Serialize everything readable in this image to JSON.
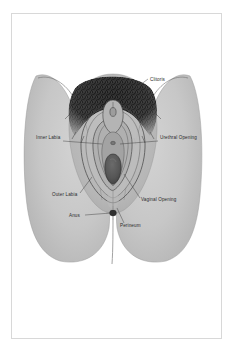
{
  "page": {
    "top_clipped_text": "· · ·",
    "background_color": "#ffffff"
  },
  "frame": {
    "border_color": "#d8d8d8",
    "fill_color": "#ffffff"
  },
  "diagram": {
    "type": "anatomical-illustration",
    "style": "greyscale line drawing with shading",
    "palette": {
      "skin_light": "#c9c9c9",
      "skin_mid": "#b8b8b8",
      "skin_shadow": "#a6a6a6",
      "inner_tissue": "#b0b0b0",
      "inner_tissue_dark": "#9a9a9a",
      "opening_dark": "#4e4e4e",
      "hair_dark": "#2f2f2f",
      "outline": "#3a3a3a",
      "label_text": "#2b2b2b",
      "leader_line": "#3a3a3a"
    },
    "labels": [
      {
        "id": "clitoris",
        "text": "Clitoris",
        "text_x": 138,
        "text_y": 67,
        "anchor": "start",
        "leader": "M 136 65 L 124 74 L 112 86"
      },
      {
        "id": "inner-labia",
        "text": "Inner Labia",
        "text_x": 24,
        "text_y": 125,
        "anchor": "start",
        "leader": "M 51 127 L 90 130"
      },
      {
        "id": "urethral-opening",
        "text": "Urethral Opening",
        "text_x": 148,
        "text_y": 125,
        "anchor": "start",
        "leader": "M 146 127 L 108 130"
      },
      {
        "id": "outer-labia",
        "text": "Outer Labia",
        "text_x": 40,
        "text_y": 182,
        "anchor": "start",
        "leader": "M 68 179 L 80 163"
      },
      {
        "id": "vaginal-opening",
        "text": "Vaginal Opening",
        "text_x": 129,
        "text_y": 187,
        "anchor": "start",
        "leader": "M 128 184 L 112 160"
      },
      {
        "id": "anus",
        "text": "Anus",
        "text_x": 57,
        "text_y": 203,
        "anchor": "start",
        "leader": "M 73 201 L 99 199"
      },
      {
        "id": "perineum",
        "text": "Perineum",
        "text_x": 108,
        "text_y": 213,
        "anchor": "start",
        "leader": "M 112 209 L 105 194"
      }
    ],
    "structures": [
      {
        "id": "left-thigh",
        "name": "Left thigh / outer body silhouette"
      },
      {
        "id": "right-thigh",
        "name": "Right thigh / outer body silhouette"
      },
      {
        "id": "mons-pubis-hair",
        "name": "Mons pubis with pubic hair"
      },
      {
        "id": "outer-labia-shape",
        "name": "Labia majora (outer labia)"
      },
      {
        "id": "inner-labia-shape",
        "name": "Labia minora (inner labia)"
      },
      {
        "id": "clitoral-hood",
        "name": "Clitoral hood and clitoris"
      },
      {
        "id": "urethral-opening-mark",
        "name": "Urethral opening"
      },
      {
        "id": "vaginal-opening-mark",
        "name": "Vaginal opening"
      },
      {
        "id": "perineum-area",
        "name": "Perineum"
      },
      {
        "id": "anus-mark",
        "name": "Anus"
      }
    ]
  }
}
